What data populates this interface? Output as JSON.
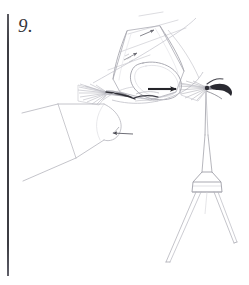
{
  "plate": {
    "figure_number": "9.",
    "background_color": "#ffffff",
    "ink_color": "#3c3c42",
    "light_ink_color": "#b9b9bf",
    "mid_ink_color": "#8a8a92",
    "width": 249,
    "height": 285
  },
  "elements": {
    "page_rule_label": "page-margin-rule",
    "upper_cone_label": "tilted-cone-structure",
    "main_arrow_label": "direction-arrow-right",
    "small_arrow_upper_label": "direction-arrow-upper",
    "small_arrow_lower_label": "direction-arrow-lower-left",
    "left_cone_label": "left-cone-outline",
    "left_brush_label": "left-feathered-brush",
    "right_brush_label": "right-feathered-brush",
    "right_hook_label": "dark-hooked-appendage",
    "stem_label": "vertical-stem",
    "tripod_label": "tripod-base-joint",
    "tripod_leg_left_label": "tripod-leg-left",
    "tripod_leg_right_label": "tripod-leg-right"
  }
}
